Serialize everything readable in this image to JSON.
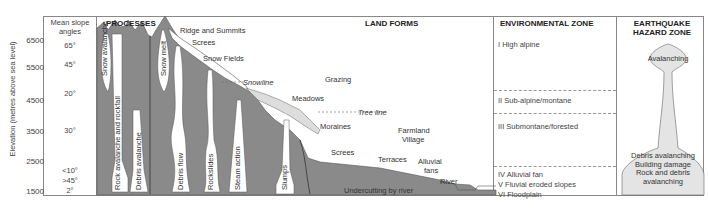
{
  "diagram": {
    "y_axis": {
      "label": "Elevation (metres above sea level)",
      "ticks": [
        "6500",
        "5500",
        "4500",
        "3500",
        "2500",
        "1500"
      ]
    },
    "columns": {
      "slope_header": "Mean slope angles",
      "processes_header": "PROCESSES",
      "landforms_header": "LAND FORMS",
      "environment_header": "ENVIRONMENTAL ZONE",
      "hazard_header_line1": "EARTHQUAKE",
      "hazard_header_line2": "HAZARD ZONE"
    },
    "slope_angles": [
      "65°",
      "45°",
      "20°",
      "30°",
      "<10°",
      ">45°",
      "2°"
    ],
    "processes": [
      "Snow avalanche",
      "Rock avalanche and rockfall",
      "Debris avalanche",
      "Snow melt",
      "Debris flow",
      "Rockslides",
      "Steam action",
      "Slumps"
    ],
    "landforms": {
      "ridge": "Ridge and Summits",
      "screes_top": "Screes",
      "snow_fields": "Snow Fields",
      "snowline": "Snowline",
      "grazing": "Grazing",
      "meadows": "Meadows",
      "tree_line": "Tree line",
      "moraines": "Moraines",
      "farmland": "Farmland",
      "village": "Village",
      "screes_bottom": "Screes",
      "terraces": "Terraces",
      "alluvial": "Alluvial",
      "fans": "fans",
      "river": "River",
      "undercutting": "Undercutting by river"
    },
    "environmental_zones": [
      "I High alpine",
      "II Sub-alpine/montane",
      "III Submontane/forested",
      "IV Alluvial fan",
      "V Fluvial eroded slopes",
      "VI Floodplain"
    ],
    "hazard": {
      "top": "Avalanching",
      "bottom_line1": "Debris avalanching",
      "bottom_line2": "Building damage",
      "bottom_line3": "Rock and debris",
      "bottom_line4": "avalanching"
    },
    "colors": {
      "mountain": "#8a8a8a",
      "snow": "#ffffff",
      "hazard_fill": "#e4e4e4",
      "lines": "#888888"
    }
  }
}
